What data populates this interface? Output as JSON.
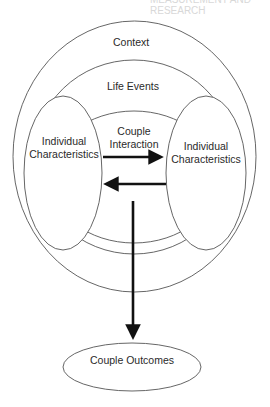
{
  "diagram": {
    "top_cut_text": "MEASUREMENT AND RESEARCH",
    "labels": {
      "context": "Context",
      "life_events": "Life Events",
      "couple_interaction_line1": "Couple",
      "couple_interaction_line2": "Interaction",
      "individual_left_line1": "Individual",
      "individual_left_line2": "Characteristics",
      "individual_right_line1": "Individual",
      "individual_right_line2": "Characteristics",
      "couple_outcomes": "Couple Outcomes"
    },
    "nodes": [
      {
        "id": "context",
        "shape": "ellipse",
        "label": "Context"
      },
      {
        "id": "life_events",
        "shape": "ellipse-arc",
        "label": "Life Events"
      },
      {
        "id": "couple_interaction",
        "shape": "ellipse-arc",
        "label": "Couple Interaction"
      },
      {
        "id": "individual_left",
        "shape": "ellipse",
        "label": "Individual Characteristics"
      },
      {
        "id": "individual_right",
        "shape": "ellipse",
        "label": "Individual Characteristics"
      },
      {
        "id": "couple_outcomes",
        "shape": "ellipse",
        "label": "Couple Outcomes"
      }
    ],
    "edges": [
      {
        "from": "individual_left",
        "to": "individual_right",
        "style": "thick-arrow"
      },
      {
        "from": "individual_right",
        "to": "individual_left",
        "style": "thick-arrow"
      },
      {
        "from": "couple_interaction",
        "to": "couple_outcomes",
        "style": "thick-arrow"
      }
    ],
    "colors": {
      "stroke": "#555555",
      "arrow": "#111111",
      "text": "#2a2a2a",
      "background": "#ffffff"
    }
  }
}
